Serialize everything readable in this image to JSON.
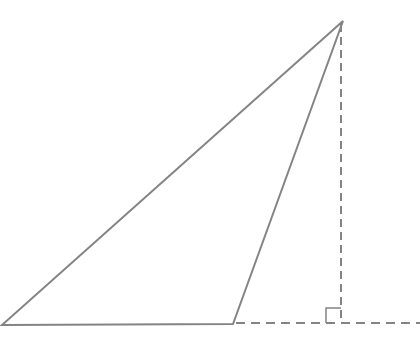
{
  "canvas": {
    "width": 420,
    "height": 347,
    "background": "#ffffff"
  },
  "diagram": {
    "kind": "obtuse-triangle-with-external-altitude",
    "stroke_color": "#848484",
    "stroke_width": 2,
    "triangle": {
      "vertices": [
        {
          "x": 2,
          "y": 325
        },
        {
          "x": 233,
          "y": 324
        },
        {
          "x": 343,
          "y": 21
        }
      ]
    },
    "altitude_line": {
      "style": "dashed",
      "dash": "8 5",
      "x1": 341,
      "y1": 24,
      "x2": 341,
      "y2": 322
    },
    "base_extension_line": {
      "style": "dashed",
      "dash": "9 6",
      "x1": 236,
      "y1": 323,
      "x2": 420,
      "y2": 323
    },
    "right_angle_marker": {
      "corner_x": 341,
      "corner_y": 323,
      "size": 15,
      "stroke_width": 1.5
    }
  }
}
